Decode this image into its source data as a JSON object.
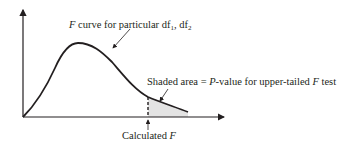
{
  "diagram": {
    "labels": {
      "curve_label_prefix": "F",
      "curve_label_text": " curve for particular df",
      "curve_label_sub1": "1",
      "curve_label_sep": ", df",
      "curve_label_sub2": "2",
      "shaded_label_prefix": "Shaded area = ",
      "shaded_label_p": "P",
      "shaded_label_mid": "-value for upper-tailed ",
      "shaded_label_f": "F",
      "shaded_label_suffix": " test",
      "calc_label_text": "Calculated ",
      "calc_label_f": "F"
    },
    "colors": {
      "line": "#231f20",
      "shade": "#e3e3e3"
    }
  }
}
